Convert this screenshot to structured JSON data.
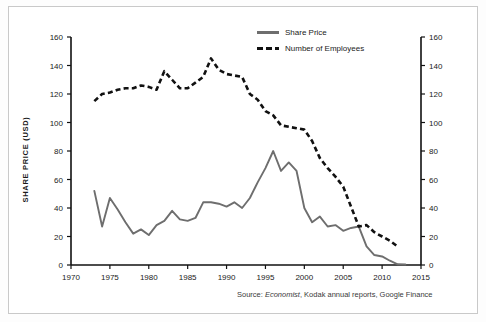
{
  "figure": {
    "border_color": "#c9c9c9",
    "background": "#ffffff"
  },
  "legend": {
    "position": "top-center-right",
    "entries": [
      {
        "label": "Share Price",
        "style": "solid",
        "color": "#6e6e6e"
      },
      {
        "label": "Number of Employees",
        "style": "dashed",
        "color": "#111111"
      }
    ]
  },
  "source": {
    "prefix": "Source: ",
    "italic": "Economist",
    "rest": ", Kodak annual reports, Google Finance"
  },
  "chart_data": {
    "type": "line",
    "title": "",
    "xlabel": "",
    "ylabel": "SHARE PRICE (USD)",
    "y2label": "NUMBER OF EMPLOYEES (THOUSANDS)",
    "xlim": [
      1970,
      2015
    ],
    "ylim": [
      0,
      160
    ],
    "y2lim": [
      0,
      160
    ],
    "xticks": [
      1970,
      1975,
      1980,
      1985,
      1990,
      1995,
      2000,
      2005,
      2010,
      2015
    ],
    "yticks": [
      0,
      20,
      40,
      60,
      80,
      100,
      120,
      140,
      160
    ],
    "y2ticks": [
      0,
      20,
      40,
      60,
      80,
      100,
      120,
      140,
      160
    ],
    "grid": false,
    "series": [
      {
        "name": "Share Price",
        "axis": "left",
        "style": "solid",
        "color": "#6e6e6e",
        "units": "USD",
        "x": [
          1973,
          1974,
          1975,
          1976,
          1977,
          1978,
          1979,
          1980,
          1981,
          1982,
          1983,
          1984,
          1985,
          1986,
          1987,
          1988,
          1989,
          1990,
          1991,
          1992,
          1993,
          1994,
          1995,
          1996,
          1997,
          1998,
          1999,
          2000,
          2001,
          2002,
          2003,
          2004,
          2005,
          2006,
          2007,
          2008,
          2009,
          2010,
          2011,
          2012,
          2013
        ],
        "y": [
          52,
          27,
          47,
          39,
          30,
          22,
          25,
          21,
          28,
          31,
          38,
          32,
          31,
          33,
          44,
          44,
          43,
          41,
          44,
          40,
          47,
          58,
          68,
          80,
          66,
          72,
          66,
          40,
          30,
          34,
          27,
          28,
          24,
          26,
          27,
          13,
          7,
          6,
          3,
          0.5,
          0.4
        ]
      },
      {
        "name": "Number of Employees",
        "axis": "right",
        "style": "dashed",
        "color": "#111111",
        "units": "thousands",
        "x": [
          1973,
          1974,
          1975,
          1976,
          1977,
          1978,
          1979,
          1980,
          1981,
          1982,
          1983,
          1984,
          1985,
          1986,
          1987,
          1988,
          1989,
          1990,
          1991,
          1992,
          1993,
          1994,
          1995,
          1996,
          1997,
          1998,
          1999,
          2000,
          2001,
          2002,
          2003,
          2004,
          2005,
          2006,
          2007,
          2008,
          2009,
          2010,
          2011,
          2012
        ],
        "y": [
          115,
          120,
          121,
          123,
          124,
          124,
          126,
          125,
          123,
          136,
          130,
          124,
          124,
          128,
          132,
          145,
          137,
          134,
          133,
          132,
          120,
          116,
          108,
          105,
          98,
          97,
          96,
          95,
          87,
          75,
          68,
          62,
          55,
          41,
          27,
          28,
          23,
          20,
          17,
          13
        ]
      }
    ]
  }
}
